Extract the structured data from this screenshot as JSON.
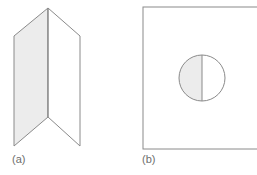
{
  "panels": [
    {
      "id": "a",
      "label": "(a)",
      "description": "folded sheet with shaded left half"
    },
    {
      "id": "b",
      "label": "(b)",
      "description": "square with circle split by vertical line, left half shaded"
    }
  ],
  "colors": {
    "stroke": "#8a8a8a",
    "shade": "#ececec",
    "background": "#ffffff"
  }
}
